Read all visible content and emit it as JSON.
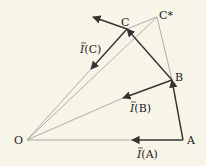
{
  "diagram": {
    "points": {
      "O": {
        "label": "O",
        "x": 27,
        "y": 140
      },
      "A": {
        "label": "A",
        "x": 183,
        "y": 140
      },
      "B": {
        "label": "B",
        "x": 172,
        "y": 80
      },
      "C": {
        "label": "C",
        "x": 127,
        "y": 29
      },
      "Cstar": {
        "label": "C*",
        "x": 157,
        "y": 17
      }
    },
    "vectors": {
      "IA": {
        "label": "⃗I(A)",
        "text": "I(A)"
      },
      "IB": {
        "label": "I(B)",
        "text": "I(B)"
      },
      "IC": {
        "label": "I(C)",
        "text": "I(C)"
      }
    },
    "colors": {
      "background": "#f7f4e8",
      "thick_line": "#333333",
      "thin_line": "#999999"
    }
  }
}
